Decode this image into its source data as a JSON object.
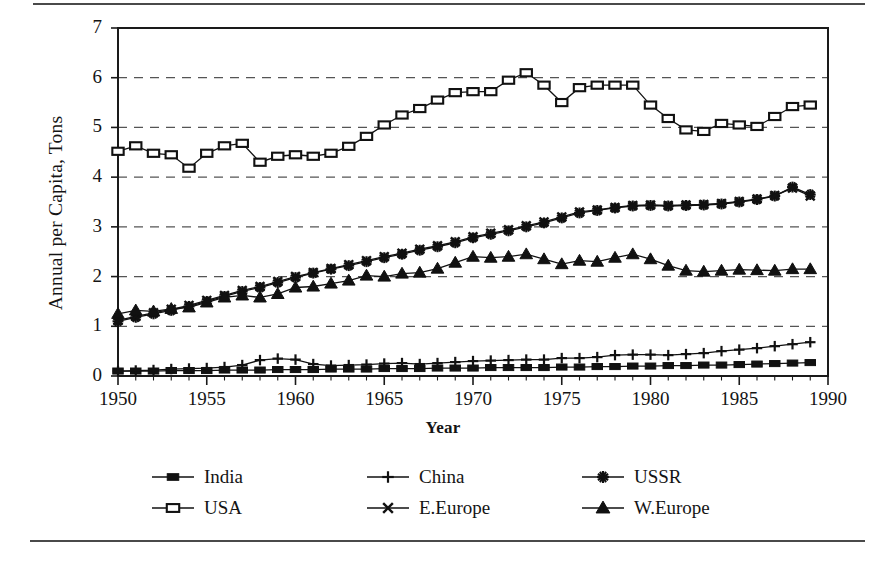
{
  "figure": {
    "has_top_rule": true,
    "has_bottom_rule": true,
    "frame_color": "#1a1a1a",
    "grid_color": "#555555",
    "series_color": "#111111"
  },
  "chart_data": {
    "type": "line",
    "title": "",
    "xlabel": "Year",
    "ylabel": "Annual per Capita, Tons",
    "xlim": [
      1950,
      1990
    ],
    "ylim": [
      0,
      7
    ],
    "xticks": [
      1950,
      1955,
      1960,
      1965,
      1970,
      1975,
      1980,
      1985,
      1990
    ],
    "yticks": [
      0,
      1,
      2,
      3,
      4,
      5,
      6,
      7
    ],
    "grid": "horizontal-dashed",
    "legend_position": "below-axes",
    "x": [
      1950,
      1951,
      1952,
      1953,
      1954,
      1955,
      1956,
      1957,
      1958,
      1959,
      1960,
      1961,
      1962,
      1963,
      1964,
      1965,
      1966,
      1967,
      1968,
      1969,
      1970,
      1971,
      1972,
      1973,
      1974,
      1975,
      1976,
      1977,
      1978,
      1979,
      1980,
      1981,
      1982,
      1983,
      1984,
      1985,
      1986,
      1987,
      1988,
      1989
    ],
    "series": [
      {
        "name": "India",
        "marker": "filled-square",
        "values": [
          0.1,
          0.1,
          0.1,
          0.11,
          0.11,
          0.11,
          0.12,
          0.12,
          0.12,
          0.13,
          0.13,
          0.13,
          0.14,
          0.14,
          0.14,
          0.15,
          0.15,
          0.15,
          0.16,
          0.16,
          0.16,
          0.17,
          0.17,
          0.17,
          0.17,
          0.18,
          0.18,
          0.19,
          0.19,
          0.2,
          0.2,
          0.21,
          0.21,
          0.22,
          0.22,
          0.23,
          0.24,
          0.25,
          0.26,
          0.27
        ]
      },
      {
        "name": "China",
        "marker": "plus",
        "values": [
          0.1,
          0.11,
          0.12,
          0.14,
          0.15,
          0.16,
          0.18,
          0.22,
          0.32,
          0.35,
          0.33,
          0.24,
          0.21,
          0.22,
          0.23,
          0.25,
          0.26,
          0.24,
          0.26,
          0.28,
          0.3,
          0.31,
          0.32,
          0.33,
          0.33,
          0.36,
          0.36,
          0.38,
          0.42,
          0.43,
          0.43,
          0.42,
          0.44,
          0.46,
          0.5,
          0.53,
          0.56,
          0.6,
          0.64,
          0.68
        ]
      },
      {
        "name": "USSR",
        "marker": "asterisk",
        "values": [
          1.1,
          1.18,
          1.25,
          1.32,
          1.4,
          1.5,
          1.6,
          1.7,
          1.78,
          1.88,
          1.98,
          2.07,
          2.15,
          2.22,
          2.3,
          2.38,
          2.45,
          2.53,
          2.6,
          2.68,
          2.78,
          2.85,
          2.92,
          3.0,
          3.08,
          3.18,
          3.28,
          3.33,
          3.38,
          3.42,
          3.43,
          3.42,
          3.43,
          3.44,
          3.46,
          3.5,
          3.55,
          3.62,
          3.8,
          3.65
        ]
      },
      {
        "name": "USA",
        "marker": "open-square",
        "values": [
          4.52,
          4.63,
          4.48,
          4.45,
          4.18,
          4.48,
          4.63,
          4.68,
          4.3,
          4.42,
          4.45,
          4.42,
          4.48,
          4.62,
          4.82,
          5.05,
          5.25,
          5.38,
          5.55,
          5.7,
          5.72,
          5.72,
          5.95,
          6.1,
          5.85,
          5.5,
          5.8,
          5.85,
          5.85,
          5.85,
          5.45,
          5.18,
          4.95,
          4.92,
          5.08,
          5.05,
          5.02,
          5.22,
          5.42,
          5.45
        ]
      },
      {
        "name": "E.Europe",
        "marker": "cross",
        "values": [
          1.12,
          1.2,
          1.27,
          1.34,
          1.42,
          1.52,
          1.62,
          1.72,
          1.8,
          1.9,
          2.0,
          2.08,
          2.16,
          2.24,
          2.32,
          2.4,
          2.47,
          2.55,
          2.62,
          2.7,
          2.8,
          2.87,
          2.94,
          3.02,
          3.1,
          3.2,
          3.3,
          3.34,
          3.39,
          3.43,
          3.44,
          3.43,
          3.44,
          3.45,
          3.47,
          3.51,
          3.56,
          3.63,
          3.78,
          3.62
        ]
      },
      {
        "name": "W.Europe",
        "marker": "filled-triangle",
        "values": [
          1.25,
          1.32,
          1.3,
          1.35,
          1.38,
          1.48,
          1.58,
          1.62,
          1.58,
          1.65,
          1.78,
          1.8,
          1.86,
          1.92,
          2.02,
          2.0,
          2.06,
          2.08,
          2.16,
          2.28,
          2.4,
          2.38,
          2.4,
          2.45,
          2.35,
          2.25,
          2.32,
          2.3,
          2.38,
          2.45,
          2.35,
          2.22,
          2.12,
          2.1,
          2.12,
          2.14,
          2.13,
          2.12,
          2.15,
          2.15
        ]
      }
    ]
  },
  "legend": {
    "rows": [
      [
        {
          "label": "India",
          "marker": "filled-square"
        },
        {
          "label": "China",
          "marker": "plus"
        },
        {
          "label": "USSR",
          "marker": "asterisk"
        }
      ],
      [
        {
          "label": "USA",
          "marker": "open-square"
        },
        {
          "label": "E.Europe",
          "marker": "cross"
        },
        {
          "label": "W.Europe",
          "marker": "filled-triangle"
        }
      ]
    ]
  }
}
